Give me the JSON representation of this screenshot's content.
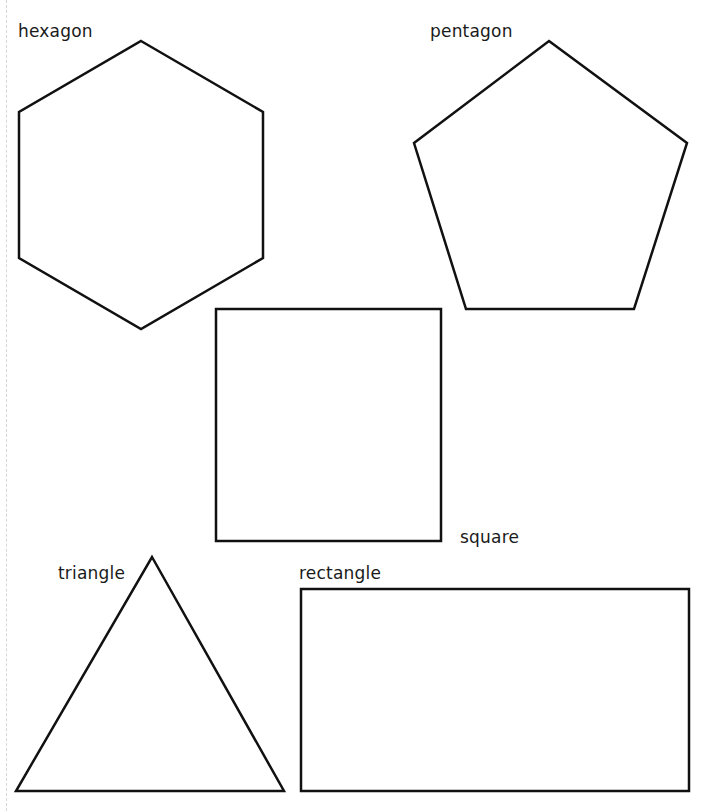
{
  "shapes": {
    "hexagon": {
      "label": "hexagon",
      "points": "141,41 263,112 263,258 141,329 19,258 19,112"
    },
    "pentagon": {
      "label": "pentagon",
      "points": "549,41 687,143 634,309 466,309 414,143"
    },
    "square": {
      "label": "square",
      "x": 216,
      "y": 309,
      "width": 225,
      "height": 232
    },
    "triangle": {
      "label": "triangle",
      "points": "152,557 284,791 16,791"
    },
    "rectangle": {
      "label": "rectangle",
      "x": 301,
      "y": 589,
      "width": 388,
      "height": 202
    }
  },
  "style": {
    "stroke_color": "#111111",
    "stroke_width": 2.5,
    "background": "#ffffff"
  }
}
